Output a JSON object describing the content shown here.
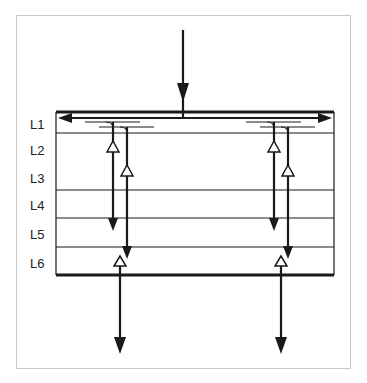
{
  "diagram": {
    "layers": [
      {
        "label": "L1",
        "y": 126
      },
      {
        "label": "L2",
        "y": 152
      },
      {
        "label": "L3",
        "y": 180
      },
      {
        "label": "L4",
        "y": 207
      },
      {
        "label": "L5",
        "y": 236
      },
      {
        "label": "L6",
        "y": 265
      }
    ],
    "colors": {
      "line": "#1a1a1a",
      "frame": "#c8c8c8"
    }
  }
}
